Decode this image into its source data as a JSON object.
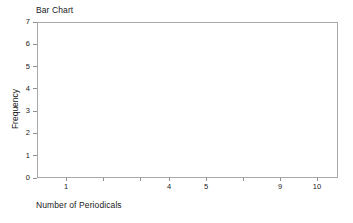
{
  "chart_data": {
    "type": "bar",
    "title": "Bar Chart",
    "xlabel": "Number of Periodicals",
    "ylabel": "Frequency",
    "categories": [
      "1",
      "",
      "",
      "4",
      "5",
      "",
      "9",
      "10"
    ],
    "values": [
      0,
      0,
      0,
      0,
      0,
      0,
      0,
      0
    ],
    "series": [
      {
        "name": "Frequency",
        "values": [
          0,
          0,
          0,
          0,
          0,
          0,
          0,
          0
        ]
      }
    ],
    "x_tick_labels": [
      "1",
      "",
      "",
      "4",
      "5",
      "",
      "9",
      "10"
    ],
    "x_tick_positions_px": [
      66,
      103,
      140,
      169,
      206,
      243,
      280,
      317
    ],
    "y_tick_labels": [
      "0",
      "1",
      "2",
      "3",
      "4",
      "5",
      "6",
      "7"
    ],
    "y_values": [
      0,
      1,
      2,
      3,
      4,
      5,
      6,
      7
    ],
    "ylim": [
      0,
      7
    ],
    "grid": false,
    "legend": false,
    "legend_position": "none",
    "plot_empty": true,
    "colors": {
      "background": "#ffffff",
      "frame": "#a8a8a8",
      "tick": "#8f8f8f",
      "text": "#1a1a1a",
      "bar": "#7f7f7f"
    }
  }
}
